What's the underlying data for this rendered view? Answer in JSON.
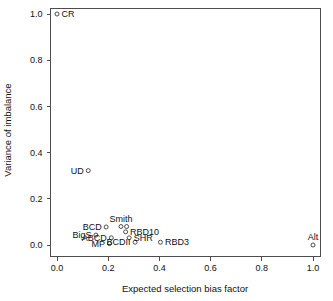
{
  "chart_data": {
    "type": "scatter",
    "title": "",
    "xlabel": "Expected selection bias factor",
    "ylabel": "Variance of imbalance",
    "xlim": [
      -0.04,
      1.07
    ],
    "ylim": [
      -0.05,
      1.05
    ],
    "xticks": [
      "0.0",
      "0.2",
      "0.4",
      "0.6",
      "0.8",
      "1.0"
    ],
    "xtickvalues": [
      0.0,
      0.2,
      0.4,
      0.6,
      0.8,
      1.0
    ],
    "yticks": [
      "0.0",
      "0.2",
      "0.4",
      "0.6",
      "0.8",
      "1.0"
    ],
    "ytickvalues": [
      0.0,
      0.2,
      0.4,
      0.6,
      0.8,
      1.0
    ],
    "grid": false,
    "legend": "none",
    "marker": "open-circle",
    "points": [
      {
        "label": "CR",
        "x": 0.0,
        "y": 1.0,
        "label_pos": "right"
      },
      {
        "label": "UD",
        "x": 0.122,
        "y": 0.322,
        "label_pos": "left"
      },
      {
        "label": "BigS",
        "x": 0.152,
        "y": 0.043,
        "label_pos": "left"
      },
      {
        "label": "BCD",
        "x": 0.192,
        "y": 0.078,
        "label_pos": "left"
      },
      {
        "label": "ABCD",
        "x": 0.212,
        "y": 0.031,
        "label_pos": "left"
      },
      {
        "label": "MP",
        "x": 0.205,
        "y": 0.006,
        "label_pos": "left"
      },
      {
        "label": "Smith",
        "x": 0.25,
        "y": 0.08,
        "label_pos": "above"
      },
      {
        "label": "",
        "x": 0.272,
        "y": 0.08,
        "label_pos": "none"
      },
      {
        "label": "RBD10",
        "x": 0.268,
        "y": 0.057,
        "label_pos": "right"
      },
      {
        "label": "SHR",
        "x": 0.282,
        "y": 0.031,
        "label_pos": "right"
      },
      {
        "label": "BCDII",
        "x": 0.305,
        "y": 0.012,
        "label_pos": "left"
      },
      {
        "label": "RBD3",
        "x": 0.404,
        "y": 0.012,
        "label_pos": "right"
      },
      {
        "label": "Alt",
        "x": 1.0,
        "y": 0.0,
        "label_pos": "above"
      }
    ]
  },
  "axes": {
    "x_title": "Expected selection bias factor",
    "y_title": "Variance of imbalance"
  },
  "colors": {
    "marker_stroke": "#3a3a3a",
    "axis": "#4d4d4d",
    "text": "#111111",
    "background": "#ffffff"
  }
}
